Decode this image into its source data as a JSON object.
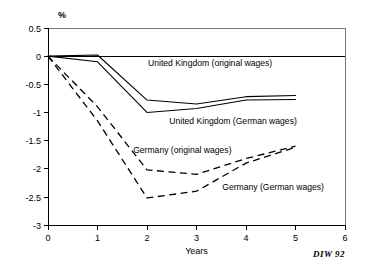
{
  "chart_data": {
    "type": "line",
    "title": "",
    "subtitle": "",
    "xlabel": "Years",
    "ylabel": "%",
    "unit_label": "%",
    "xlim": [
      0,
      6
    ],
    "ylim": [
      -3,
      0.5
    ],
    "grid": false,
    "legend_position": "inline-annotations",
    "x_ticks": [
      "0",
      "1",
      "2",
      "3",
      "4",
      "5",
      "6"
    ],
    "x_tick_values": [
      0,
      1,
      2,
      3,
      4,
      5,
      6
    ],
    "y_ticks": [
      "0.5",
      "0",
      "-0.5",
      "-1",
      "-1.5",
      "-2",
      "-2.5",
      "-3"
    ],
    "y_tick_values": [
      0.5,
      0,
      -0.5,
      -1,
      -1.5,
      -2,
      -2.5,
      -3
    ],
    "zero_reference_line": 0,
    "x": [
      0,
      1,
      2,
      3,
      4,
      5
    ],
    "series": [
      {
        "name": "United Kingdom  (original wages)",
        "style": "solid",
        "values": [
          0,
          0.02,
          -0.78,
          -0.85,
          -0.72,
          -0.7
        ]
      },
      {
        "name": "United Kingdom  (German wages)",
        "style": "solid",
        "values": [
          0,
          -0.1,
          -1.0,
          -0.93,
          -0.78,
          -0.77
        ]
      },
      {
        "name": "Germany (original wages)",
        "style": "dashed",
        "values": [
          0,
          -0.9,
          -2.02,
          -2.1,
          -1.82,
          -1.6
        ]
      },
      {
        "name": "Germany  (German wages)",
        "style": "dashed",
        "values": [
          0,
          -1.15,
          -2.52,
          -2.4,
          -1.9,
          -1.62
        ]
      }
    ],
    "annotations": [
      {
        "text": "United Kingdom  (original wages)",
        "x": 2.02,
        "y": -0.18
      },
      {
        "text": "United Kingdom  (German wages)",
        "x": 2.45,
        "y": -1.2
      },
      {
        "text": "Germany (original wages)",
        "x": 1.72,
        "y": -1.72
      },
      {
        "text": "Germany  (German wages)",
        "x": 3.52,
        "y": -2.38
      }
    ],
    "source": "DIW 92"
  }
}
